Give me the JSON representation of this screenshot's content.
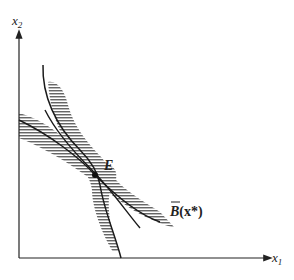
{
  "diagram": {
    "axes": {
      "x_label": "x",
      "x_sub": "1",
      "y_label": "x",
      "y_sub": "2"
    },
    "point": {
      "label": "E"
    },
    "curve_label": {
      "base": "B",
      "arg": "(x*)"
    },
    "colors": {
      "line": "#1a1a1a",
      "hatch": "#555555",
      "background": "#ffffff"
    }
  }
}
